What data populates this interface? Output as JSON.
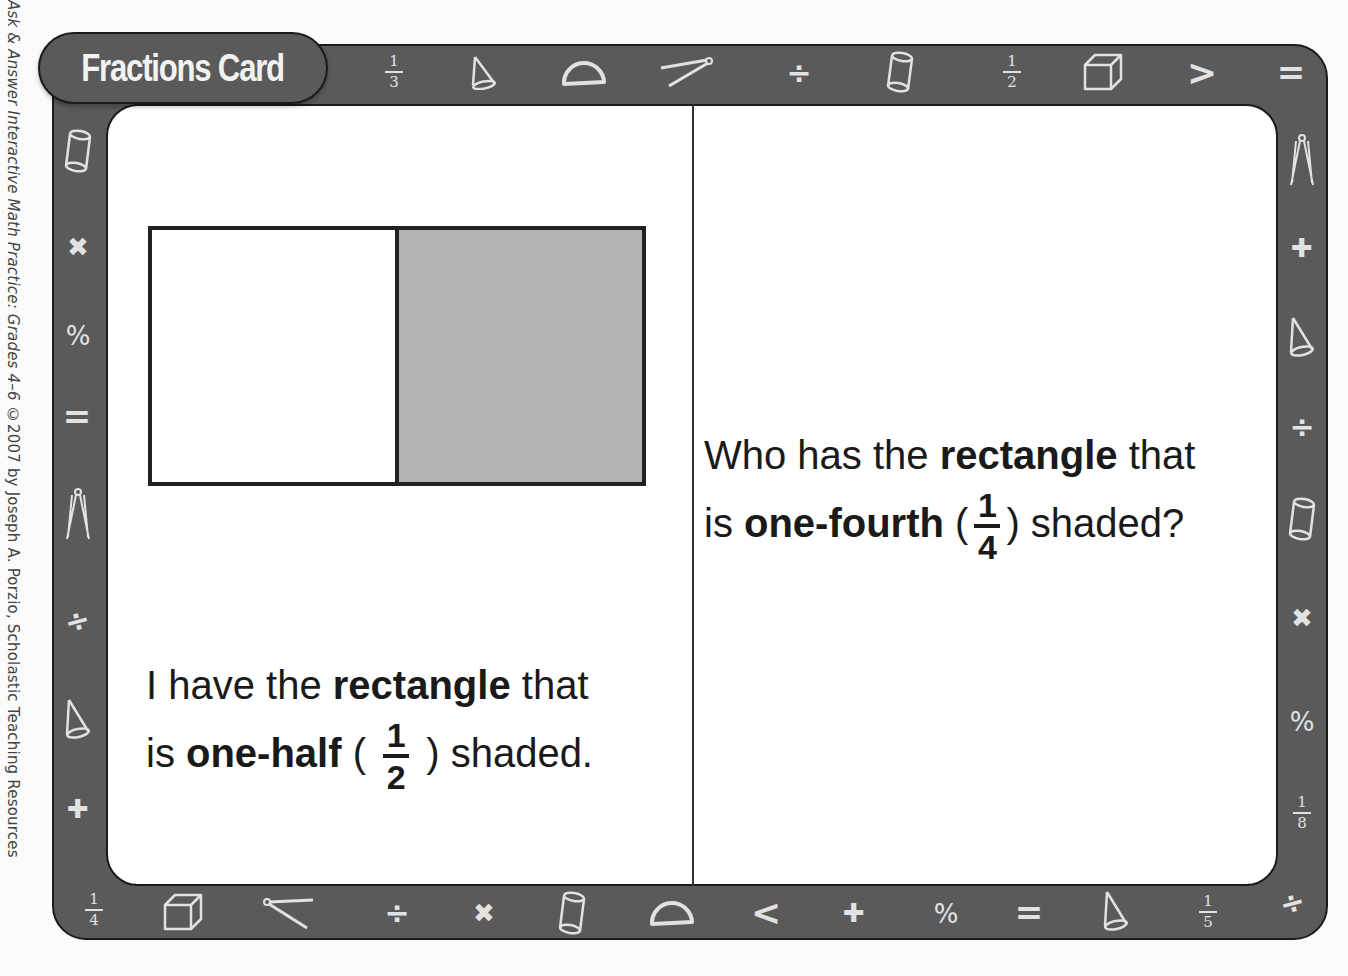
{
  "credit": {
    "book_title": "Ask & Answer Interactive Math Practice: Grades 4–6",
    "copyright": " ©2007 by Joseph A. Porzio, Scholastic Teaching Resources"
  },
  "card": {
    "title": "Fractions Card",
    "colors": {
      "frame": "#5a5a5a",
      "outline": "#1a1a1a",
      "symbol": "#e2e2e2",
      "shaded": "#b3b3b3"
    }
  },
  "left_side": {
    "figure": {
      "type": "rectangle",
      "parts": 2,
      "shaded_parts": 1
    },
    "line1_pre": "I have the ",
    "line1_bold": "rectangle",
    "line1_post": " that",
    "line2_pre": "is ",
    "line2_bold": "one-half",
    "open_paren": " ( ",
    "fraction_num": "1",
    "fraction_den": "2",
    "close_paren": " ) ",
    "line2_post": "shaded."
  },
  "right_side": {
    "line1_pre": "Who has the ",
    "line1_bold": "rectangle",
    "line1_post": " that",
    "line2_pre": "is ",
    "line2_bold": "one-fourth",
    "open_paren": " (",
    "fraction_num": "1",
    "fraction_den": "4",
    "close_paren": ") ",
    "line2_post": "shaded?"
  },
  "border_symbols": {
    "top": [
      "fraction-1/3",
      "cone",
      "protractor",
      "compass",
      "divide",
      "cylinder",
      "fraction-1/2",
      "cube",
      "greater-than",
      "equals"
    ],
    "right": [
      "compass",
      "plus",
      "cone",
      "divide",
      "cylinder",
      "times",
      "percent",
      "fraction-1/8",
      "divide"
    ],
    "bottom": [
      "fraction-1/4",
      "cube",
      "compass",
      "divide",
      "times",
      "cylinder",
      "protractor",
      "less-than",
      "plus",
      "percent",
      "equals",
      "cone",
      "fraction-1/5"
    ],
    "left": [
      "cylinder",
      "times",
      "percent",
      "equals",
      "compass",
      "divide",
      "cone",
      "plus"
    ],
    "fractions": {
      "top_1": {
        "num": "1",
        "den": "3"
      },
      "top_2": {
        "num": "1",
        "den": "2"
      },
      "right_1": {
        "num": "1",
        "den": "8"
      },
      "bottom_1": {
        "num": "1",
        "den": "4"
      },
      "bottom_2": {
        "num": "1",
        "den": "5"
      }
    },
    "glyphs": {
      "divide": "÷",
      "times": "✖",
      "plus": "✚",
      "percent": "%",
      "equals": "=",
      "greater": ">",
      "less": "<"
    }
  }
}
